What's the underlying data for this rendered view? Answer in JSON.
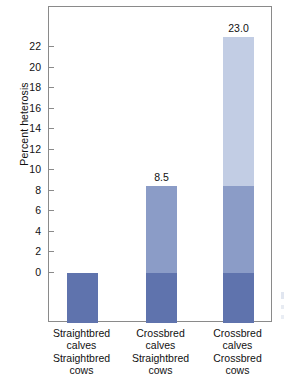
{
  "chart_data": {
    "type": "bar",
    "title": "",
    "subtitle": "",
    "xlabel": "",
    "ylabel": "Percent heterosis",
    "ylim": [
      -6,
      24
    ],
    "yticks": [
      0,
      2,
      4,
      6,
      8,
      10,
      12,
      14,
      16,
      18,
      20,
      22
    ],
    "grid": false,
    "legend": "none",
    "categories": [
      "Straightbred calves Straightbred cows",
      "Crossbred calves Straightbred cows",
      "Crossbred calves Crossbred cows"
    ],
    "category_lines": [
      [
        "Straightbred",
        "calves",
        "Straightbred",
        "cows"
      ],
      [
        "Crossbred",
        "calves",
        "Straightbred",
        "cows"
      ],
      [
        "Crossbred",
        "calves",
        "Crossbred",
        "cows"
      ]
    ],
    "values": [
      0.0,
      8.5,
      23.0
    ],
    "value_labels": [
      "",
      "8.5",
      "23.0"
    ],
    "series": [
      {
        "name": "Individual heterosis",
        "values": [
          0.0,
          8.5,
          8.5
        ]
      },
      {
        "name": "Maternal heterosis",
        "values": [
          0.0,
          0.0,
          14.5
        ]
      }
    ],
    "colors": {
      "segment_top": "#c2cde4",
      "segment_mid": "#8b9cc7",
      "segment_base": "#5f73ad",
      "frame": "#8a8a8a",
      "text": "#111111",
      "background": "#ffffff"
    }
  },
  "axis": {
    "tick_labels": [
      "22",
      "20",
      "18",
      "16",
      "14",
      "12",
      "10",
      "8",
      "6",
      "4",
      "2",
      "0"
    ]
  },
  "bars": [
    {
      "name": "straightbred-straightbred",
      "value_label": "",
      "lines": [
        "Straightbred",
        "calves",
        "Straightbred",
        "cows"
      ]
    },
    {
      "name": "crossbred-straightbred",
      "value_label": "8.5",
      "lines": [
        "Crossbred",
        "calves",
        "Straightbred",
        "cows"
      ]
    },
    {
      "name": "crossbred-crossbred",
      "value_label": "23.0",
      "lines": [
        "Crossbred",
        "calves",
        "Crossbred",
        "cows"
      ]
    }
  ]
}
